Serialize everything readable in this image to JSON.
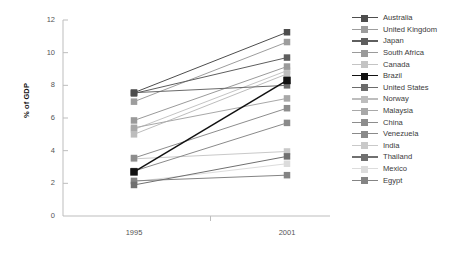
{
  "chart_data": {
    "type": "line",
    "title": "",
    "subtitle": "",
    "xlabel": "",
    "ylabel": "% of GDP",
    "x": [
      "1995",
      "2001"
    ],
    "categories": [
      "1995",
      "2001"
    ],
    "xtick_labels": [
      "1995",
      "2001"
    ],
    "ytick_labels": [
      "0",
      "2",
      "4",
      "6",
      "8",
      "10",
      "12"
    ],
    "yticks": [
      0,
      2,
      4,
      6,
      8,
      10,
      12
    ],
    "ylim": [
      0,
      12
    ],
    "grid": false,
    "legend_position": "right",
    "series": [
      {
        "name": "Australia",
        "values": [
          7.55,
          11.25
        ],
        "color": "#4d4d4d"
      },
      {
        "name": "United Kingdom",
        "values": [
          7.0,
          10.65
        ],
        "color": "#9d9d9d"
      },
      {
        "name": "Japan",
        "values": [
          7.5,
          9.7
        ],
        "color": "#5e5e5e"
      },
      {
        "name": "South Africa",
        "values": [
          5.85,
          9.15
        ],
        "color": "#9a9a9a"
      },
      {
        "name": "Canada",
        "values": [
          5.3,
          8.9
        ],
        "color": "#c4c4c4"
      },
      {
        "name": "Brazil",
        "values": [
          2.7,
          8.3
        ],
        "color": "#111111"
      },
      {
        "name": "United States",
        "values": [
          7.55,
          8.0
        ],
        "color": "#6b6b6b"
      },
      {
        "name": "Norway",
        "values": [
          5.0,
          8.7
        ],
        "color": "#bdbdbd"
      },
      {
        "name": "Malaysia",
        "values": [
          5.4,
          7.2
        ],
        "color": "#a8a8a8"
      },
      {
        "name": "China",
        "values": [
          3.55,
          6.6
        ],
        "color": "#8d8d8d"
      },
      {
        "name": "Venezuela",
        "values": [
          2.75,
          5.7
        ],
        "color": "#8a8a8a"
      },
      {
        "name": "India",
        "values": [
          3.5,
          3.95
        ],
        "color": "#c9c9c9"
      },
      {
        "name": "Thailand",
        "values": [
          1.9,
          3.65
        ],
        "color": "#707070"
      },
      {
        "name": "Mexico",
        "values": [
          2.1,
          3.2
        ],
        "color": "#dcdcdc"
      },
      {
        "name": "Egypt",
        "values": [
          2.15,
          2.5
        ],
        "color": "#848484"
      }
    ]
  },
  "axis": {
    "y_label": "% of GDP",
    "y_ticks": [
      "12",
      "10",
      "8",
      "6",
      "4",
      "2",
      "0"
    ],
    "x_ticks": [
      "1995",
      "2001"
    ]
  },
  "legend": {
    "items": [
      {
        "label": "Australia"
      },
      {
        "label": "United Kingdom"
      },
      {
        "label": "Japan"
      },
      {
        "label": "South Africa"
      },
      {
        "label": "Canada"
      },
      {
        "label": "Brazil"
      },
      {
        "label": "United States"
      },
      {
        "label": "Norway"
      },
      {
        "label": "Malaysia"
      },
      {
        "label": "China"
      },
      {
        "label": "Venezuela"
      },
      {
        "label": "India"
      },
      {
        "label": "Thailand"
      },
      {
        "label": "Mexico"
      },
      {
        "label": "Egypt"
      }
    ]
  },
  "style": {
    "axis_color": "#bdbdbd",
    "tick_text_color": "#555555",
    "legend_text_color": "#3a3a3a",
    "background": "#ffffff"
  }
}
